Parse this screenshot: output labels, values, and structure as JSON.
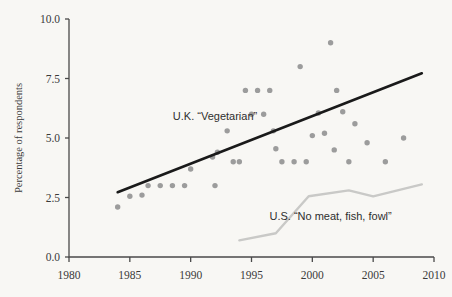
{
  "chart_data": {
    "type": "scatter",
    "title": "",
    "xlabel": "",
    "ylabel": "Percentage of respondents",
    "xlim": [
      1980,
      2010
    ],
    "ylim": [
      0.0,
      10.0
    ],
    "grid": false,
    "legend_position": "inline-annotations",
    "x_ticks": [
      "1980",
      "1985",
      "1990",
      "1995",
      "2000",
      "2005",
      "2010"
    ],
    "x_tick_values": [
      1980,
      1985,
      1990,
      1995,
      2000,
      2005,
      2010
    ],
    "y_ticks": [
      "0.0",
      "2.5",
      "5.0",
      "7.5",
      "10.0"
    ],
    "y_tick_values": [
      0.0,
      2.5,
      5.0,
      7.5,
      10.0
    ],
    "annotations": [
      {
        "name": "uk-series-label",
        "text": "U.K. “Vegetarian”",
        "x": 1992.0,
        "y": 5.75
      },
      {
        "name": "us-series-label",
        "text": "U.S. “No meat, fish, fowl”",
        "x": 2001.5,
        "y": 1.55
      }
    ],
    "series": [
      {
        "name": "U.K. “Vegetarian”",
        "type": "scatter",
        "color": "#9c9c9c",
        "points": [
          [
            1984.0,
            2.1
          ],
          [
            1985.0,
            2.55
          ],
          [
            1986.0,
            2.6
          ],
          [
            1986.5,
            3.0
          ],
          [
            1987.5,
            3.0
          ],
          [
            1988.5,
            3.0
          ],
          [
            1989.5,
            3.0
          ],
          [
            1990.0,
            3.7
          ],
          [
            1991.8,
            4.2
          ],
          [
            1992.2,
            4.4
          ],
          [
            1992.0,
            3.0
          ],
          [
            1993.0,
            5.3
          ],
          [
            1993.5,
            4.0
          ],
          [
            1994.0,
            4.0
          ],
          [
            1994.5,
            7.0
          ],
          [
            1995.5,
            7.0
          ],
          [
            1996.5,
            7.0
          ],
          [
            1995.0,
            6.0
          ],
          [
            1996.0,
            6.0
          ],
          [
            1996.8,
            5.3
          ],
          [
            1997.0,
            4.55
          ],
          [
            1997.5,
            4.0
          ],
          [
            1998.5,
            4.0
          ],
          [
            1999.5,
            4.0
          ],
          [
            1999.0,
            8.0
          ],
          [
            2000.0,
            5.1
          ],
          [
            2000.5,
            6.05
          ],
          [
            2001.5,
            9.0
          ],
          [
            2001.0,
            5.2
          ],
          [
            2001.8,
            4.5
          ],
          [
            2002.0,
            7.0
          ],
          [
            2002.5,
            6.1
          ],
          [
            2003.0,
            4.0
          ],
          [
            2003.5,
            5.6
          ],
          [
            2004.5,
            4.8
          ],
          [
            2006.0,
            4.0
          ],
          [
            2007.5,
            5.0
          ]
        ]
      },
      {
        "name": "U.K. trend line",
        "type": "line",
        "color": "#1a1a1a",
        "points": [
          [
            1984.0,
            2.72
          ],
          [
            2009.0,
            7.72
          ]
        ]
      },
      {
        "name": "U.S. “No meat, fish, fowl”",
        "type": "line",
        "color": "#c9c9c7",
        "points": [
          [
            1994.0,
            0.7
          ],
          [
            1997.0,
            1.0
          ],
          [
            1999.7,
            2.55
          ],
          [
            2003.0,
            2.8
          ],
          [
            2005.0,
            2.55
          ],
          [
            2009.0,
            3.05
          ]
        ]
      }
    ]
  },
  "colors": {
    "background": "#f8f7f4",
    "axis": "#4a4a4a",
    "scatter": "#9c9c9c",
    "trend": "#1a1a1a",
    "us_line": "#c9c9c7",
    "text": "#2e2e2e"
  }
}
